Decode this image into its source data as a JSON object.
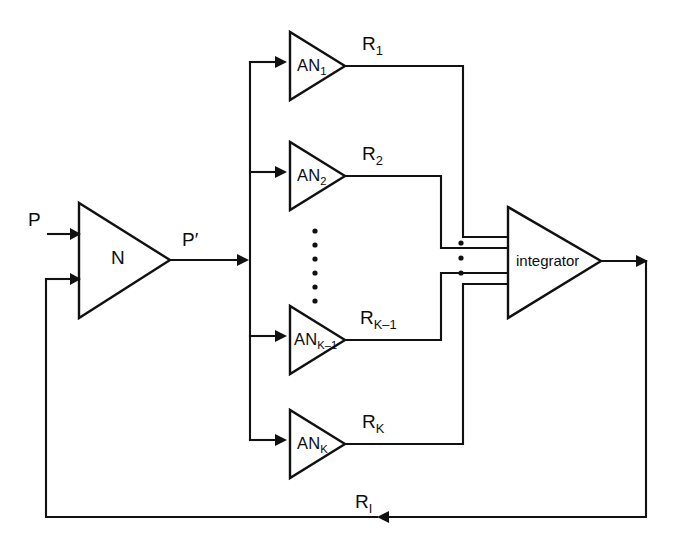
{
  "diagram": {
    "type": "block-diagram",
    "background_color": "#ffffff",
    "line_color": "#111111",
    "signals": {
      "input": "P",
      "network_output": "P′",
      "feedback": "R",
      "feedback_sub": "I"
    },
    "network_block": {
      "label": "N",
      "shape": "triangle",
      "input_count": 2
    },
    "integrator_block": {
      "label": "integrator",
      "shape": "triangle",
      "input_count": 4
    },
    "branches": [
      {
        "name": "AN",
        "sub": "1",
        "out": "R",
        "out_sub": "1"
      },
      {
        "name": "AN",
        "sub": "2",
        "out": "R",
        "out_sub": "2"
      },
      {
        "name": "AN",
        "sub": "K–1",
        "out": "R",
        "out_sub": "K–1"
      },
      {
        "name": "AN",
        "sub": "K",
        "out": "R",
        "out_sub": "K"
      }
    ],
    "ellipsis": {
      "branch_dots": 6,
      "integrator_dots": 3
    }
  }
}
